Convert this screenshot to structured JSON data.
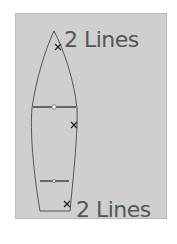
{
  "diagram": {
    "top_label": "2 Lines",
    "bottom_label": "2 Lines",
    "colors": {
      "background": "#cfcfcf",
      "hull_outline": "#555555",
      "text": "#555555",
      "marker": "#222222"
    },
    "markers": [
      {
        "symbol": "x",
        "position": "bow"
      },
      {
        "symbol": "x",
        "position": "mid-starboard"
      },
      {
        "symbol": "x",
        "position": "stern"
      }
    ],
    "thwarts": [
      "forward-thwart",
      "aft-thwart"
    ]
  }
}
